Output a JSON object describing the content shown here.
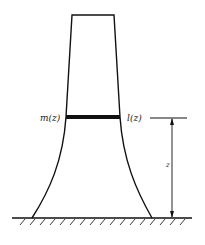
{
  "diagram": {
    "type": "tower-cross-section",
    "labels": {
      "mass_label": "m(z)",
      "stiffness_label": "l(z)",
      "height_label": "z"
    },
    "colors": {
      "line": "#111111",
      "background": "#ffffff"
    }
  }
}
